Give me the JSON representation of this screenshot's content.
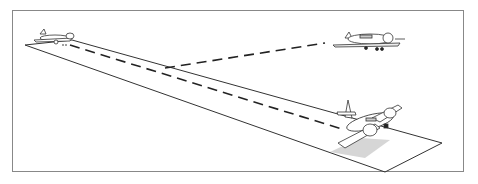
{
  "illustration": {
    "description": "Line drawing of a runway in perspective with three airplanes connected by dashed lines",
    "objects": [
      {
        "name": "airplane-far-left",
        "type": "airplane"
      },
      {
        "name": "airplane-right",
        "type": "airplane"
      },
      {
        "name": "airplane-front",
        "type": "airplane"
      }
    ],
    "colors": {
      "line": "#222222",
      "frame": "#888888",
      "shadow": "#bbbbbb"
    }
  }
}
